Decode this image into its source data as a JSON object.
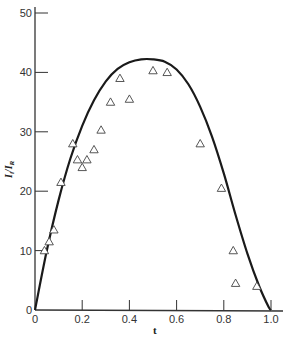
{
  "chart_data": {
    "type": "scatter",
    "title": "",
    "xlabel": "t",
    "ylabel": "I_i/I_R",
    "xlim": [
      0,
      1.0
    ],
    "ylim": [
      0,
      50
    ],
    "grid": false,
    "legend": null,
    "x_ticks": [
      "0",
      "0.2",
      "0.4",
      "0.6",
      "0.8",
      "1.0"
    ],
    "y_ticks": [
      "0",
      "10",
      "20",
      "30",
      "40",
      "50"
    ],
    "series": [
      {
        "name": "measured",
        "marker": "open-triangle",
        "points": [
          [
            0.04,
            10
          ],
          [
            0.06,
            11.5
          ],
          [
            0.08,
            13.5
          ],
          [
            0.11,
            21.5
          ],
          [
            0.16,
            28
          ],
          [
            0.18,
            25.3
          ],
          [
            0.2,
            24
          ],
          [
            0.22,
            25.3
          ],
          [
            0.25,
            27
          ],
          [
            0.28,
            30.3
          ],
          [
            0.32,
            35
          ],
          [
            0.36,
            39
          ],
          [
            0.4,
            35.5
          ],
          [
            0.5,
            40.3
          ],
          [
            0.56,
            40
          ],
          [
            0.7,
            28
          ],
          [
            0.79,
            20.5
          ],
          [
            0.84,
            10
          ],
          [
            0.85,
            4.5
          ],
          [
            0.94,
            4
          ]
        ]
      },
      {
        "name": "theory",
        "style": "solid-line",
        "points": [
          [
            0,
            0
          ],
          [
            0.05,
            10
          ],
          [
            0.1,
            18.5
          ],
          [
            0.15,
            25.5
          ],
          [
            0.2,
            31
          ],
          [
            0.25,
            35.3
          ],
          [
            0.3,
            38.5
          ],
          [
            0.35,
            40.6
          ],
          [
            0.4,
            41.7
          ],
          [
            0.45,
            42.2
          ],
          [
            0.5,
            42.2
          ],
          [
            0.55,
            41.8
          ],
          [
            0.6,
            40.5
          ],
          [
            0.65,
            38
          ],
          [
            0.7,
            34.2
          ],
          [
            0.75,
            29.2
          ],
          [
            0.8,
            23
          ],
          [
            0.85,
            16
          ],
          [
            0.9,
            9.5
          ],
          [
            0.95,
            4
          ],
          [
            0.99,
            0.5
          ],
          [
            1.0,
            0
          ]
        ]
      }
    ]
  },
  "axes": {
    "x_title": "t",
    "y_title_main": "I",
    "y_title_sub1": "i",
    "y_title_slash": "/I",
    "y_title_sub2": "R"
  }
}
